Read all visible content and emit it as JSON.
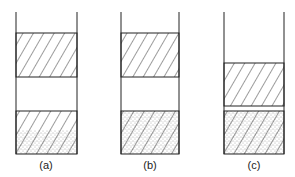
{
  "figure": {
    "panels": [
      {
        "label": "(a)",
        "description": "Column with upper hatched layer, clear gap, lower hatched layer with dotted (sediment) bottom portion"
      },
      {
        "label": "(b)",
        "description": "Column with upper hatched layer, clear gap, lower layer fully dotted and hatched"
      },
      {
        "label": "(c)",
        "description": "Column with upper hatched layer lowered, thin gap, lower dotted and hatched layer"
      }
    ]
  },
  "colors": {
    "stroke": "#222222",
    "background": "#ffffff"
  }
}
